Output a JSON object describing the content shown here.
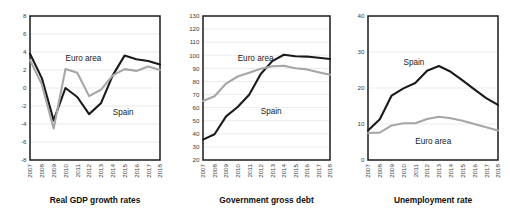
{
  "figure": {
    "name": "spain-vs-euro-area-macro-panels",
    "panel_count": 3
  },
  "colors": {
    "spain": "#1a1a1a",
    "euro_area": "#a6a6a6",
    "grid": "#e3e3e3",
    "frame": "#1a1a1a",
    "background": "#ffffff"
  },
  "chart_data": [
    {
      "type": "line",
      "title": "Real GDP growth rates",
      "xlabel": "",
      "ylabel": "",
      "x": [
        "2007",
        "2008",
        "2009",
        "2010",
        "2011",
        "2012",
        "2013",
        "2014",
        "2015",
        "2016",
        "2017",
        "2018"
      ],
      "yticks": [
        -8,
        -6,
        -4,
        -2,
        0,
        2,
        4,
        6,
        8
      ],
      "ylim": [
        -8,
        8
      ],
      "grid": true,
      "legend_position": "inline-annotation",
      "series": [
        {
          "name": "Spain",
          "color": "#1a1a1a",
          "values": [
            3.8,
            1.1,
            -3.6,
            0.0,
            -1.0,
            -2.9,
            -1.7,
            1.4,
            3.6,
            3.2,
            3.0,
            2.6
          ],
          "label_x": "2014",
          "label_y": -3.0
        },
        {
          "name": "Euro area",
          "color": "#a6a6a6",
          "values": [
            3.1,
            0.4,
            -4.5,
            2.1,
            1.7,
            -0.9,
            -0.2,
            1.4,
            2.1,
            1.9,
            2.4,
            2.0
          ],
          "label_x": "2010",
          "label_y": 3.0
        }
      ]
    },
    {
      "type": "line",
      "title": "Government gross debt",
      "xlabel": "",
      "ylabel": "",
      "x": [
        "2007",
        "2008",
        "2009",
        "2010",
        "2011",
        "2012",
        "2013",
        "2014",
        "2015",
        "2016",
        "2017",
        "2018"
      ],
      "yticks": [
        20,
        30,
        40,
        50,
        60,
        70,
        80,
        90,
        100,
        110,
        120,
        130
      ],
      "ylim": [
        20,
        130
      ],
      "grid": true,
      "legend_position": "inline-annotation",
      "series": [
        {
          "name": "Spain",
          "color": "#1a1a1a",
          "values": [
            35.6,
            39.7,
            53.3,
            60.5,
            69.9,
            85.7,
            95.5,
            100.4,
            99.3,
            99.0,
            98.1,
            97.1
          ],
          "label_x": "2012",
          "label_y": 55
        },
        {
          "name": "Euro area",
          "color": "#a6a6a6",
          "values": [
            65.0,
            68.7,
            78.4,
            83.8,
            86.7,
            89.7,
            91.6,
            92.0,
            90.1,
            89.2,
            87.1,
            85.1
          ],
          "label_x": "2010",
          "label_y": 96
        }
      ]
    },
    {
      "type": "line",
      "title": "Unemployment rate",
      "xlabel": "",
      "ylabel": "",
      "x": [
        "2007",
        "2008",
        "2009",
        "2010",
        "2011",
        "2012",
        "2013",
        "2014",
        "2015",
        "2016",
        "2017",
        "2018"
      ],
      "yticks": [
        0,
        10,
        20,
        30,
        40
      ],
      "ylim": [
        0,
        40
      ],
      "grid": true,
      "legend_position": "inline-annotation",
      "series": [
        {
          "name": "Spain",
          "color": "#1a1a1a",
          "values": [
            8.2,
            11.3,
            17.9,
            19.9,
            21.4,
            24.8,
            26.1,
            24.5,
            22.1,
            19.6,
            17.2,
            15.3
          ],
          "label_x": "2010",
          "label_y": 26.5
        },
        {
          "name": "Euro area",
          "color": "#a6a6a6",
          "values": [
            7.5,
            7.6,
            9.6,
            10.2,
            10.2,
            11.4,
            12.0,
            11.6,
            10.9,
            10.0,
            9.1,
            8.2
          ],
          "label_x": "2011",
          "label_y": 4.5
        }
      ]
    }
  ]
}
